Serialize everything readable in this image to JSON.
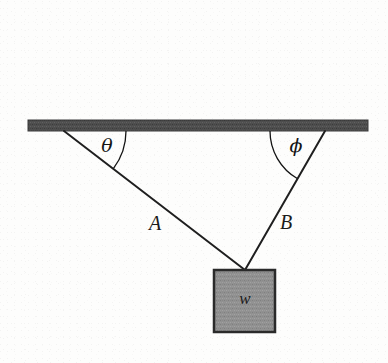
{
  "figure": {
    "background_color": "#fdfdfc",
    "ink_color": "#1b1b1b"
  },
  "ceiling": {
    "name": "ceiling-bar",
    "fill_color": "#4e4e4e",
    "edge_color": "#3a3a3a",
    "x1": 28,
    "y1": 120,
    "x2": 368,
    "y2": 131
  },
  "ropes": [
    {
      "label": "A",
      "name": "rope-a",
      "anchor_x": 64,
      "anchor_y": 131,
      "knot_x": 245,
      "knot_y": 270,
      "label_x": 155,
      "label_y": 230,
      "color": "#1f1f1f"
    },
    {
      "label": "B",
      "name": "rope-b",
      "anchor_x": 325,
      "anchor_y": 131,
      "knot_x": 245,
      "knot_y": 270,
      "label_x": 286,
      "label_y": 229,
      "color": "#1f1f1f"
    }
  ],
  "angles": [
    {
      "symbol": "θ",
      "name": "angle-theta",
      "vertex_x": 64,
      "vertex_y": 131,
      "label_x": 107,
      "label_y": 152,
      "arc_radius": 62,
      "color": "#141414"
    },
    {
      "symbol": "ϕ",
      "name": "angle-phi",
      "vertex_x": 325,
      "vertex_y": 131,
      "label_x": 296,
      "label_y": 152,
      "arc_radius": 55,
      "color": "#141414"
    }
  ],
  "weight": {
    "label": "w",
    "name": "weight-block",
    "fill_color": "#919191",
    "edge_color": "#2a2a2a",
    "x": 214,
    "y": 270,
    "width": 61,
    "height": 62,
    "label_x": 245,
    "label_y": 304
  },
  "chart_data": {
    "type": "diagram",
    "elements": {
      "support": "horizontal ceiling bar",
      "rope_count": 2,
      "rope_labels": [
        "A",
        "B"
      ],
      "angle_labels": [
        "θ",
        "ϕ"
      ],
      "load_label": "w"
    }
  }
}
